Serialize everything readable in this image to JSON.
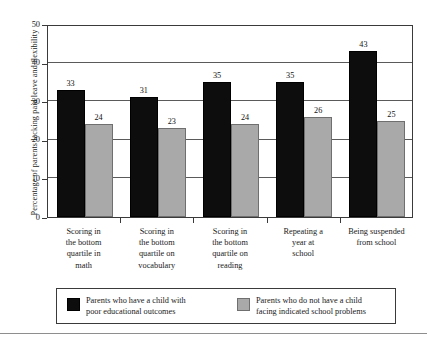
{
  "chart_data": {
    "type": "bar",
    "title": "",
    "subtitle": "",
    "xlabel": "",
    "ylabel": "Percentage of parents lacking paid leave and flexibility",
    "ylim": [
      0,
      50
    ],
    "ytick_labels": [
      "0",
      "10",
      "20",
      "30",
      "40",
      "50"
    ],
    "ytick_values": [
      0,
      10,
      20,
      30,
      40,
      50
    ],
    "grid": true,
    "grid_axis": "y",
    "legend_position": "bottom",
    "categories": [
      "Scoring in\nthe bottom\nquartile in\nmath",
      "Scoring in\nthe bottom\nquartile on\nvocabulary",
      "Scoring in\nthe bottom\nquartile on\nreading",
      "Repeating a\nyear at\nschool",
      "Being suspended\nfrom school"
    ],
    "series": [
      {
        "name": "Parents who have a child with\npoor educational outcomes",
        "color": "#0d0d0d",
        "values": [
          33,
          31,
          35,
          35,
          43
        ],
        "labels": [
          "33",
          "31",
          "35",
          "35",
          "43"
        ]
      },
      {
        "name": "Parents who do not have a child\nfacing indicated school problems",
        "color": "#a9a9a9",
        "values": [
          24,
          23,
          24,
          26,
          25
        ],
        "labels": [
          "24",
          "23",
          "24",
          "26",
          "25"
        ]
      }
    ]
  },
  "legend": {
    "items": [
      {
        "swatch": "dark",
        "label": "Parents who have a child with\npoor educational outcomes"
      },
      {
        "swatch": "light",
        "label": "Parents who do not have a child\nfacing indicated school problems"
      }
    ]
  }
}
